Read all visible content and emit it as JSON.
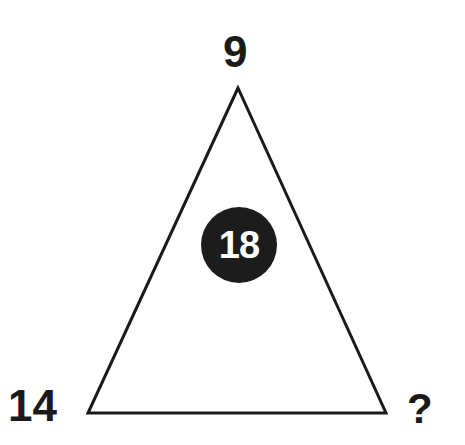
{
  "puzzle": {
    "shape": "triangle",
    "top_value": "9",
    "bottom_left_value": "14",
    "bottom_right_value": "?",
    "center_value": "18",
    "colors": {
      "background": "#ffffff",
      "stroke": "#1a1a1a",
      "circle_fill": "#1c1c1c",
      "circle_text": "#ffffff"
    }
  }
}
